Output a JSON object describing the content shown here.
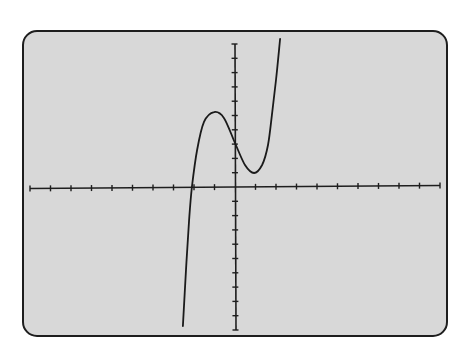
{
  "colors": {
    "background": "#ffffff",
    "screen_fill": "#d8d8d8",
    "frame_stroke": "#1e1e1e",
    "axis": "#1e1e1e",
    "curve": "#1a1a1a"
  },
  "chart_data": {
    "type": "line",
    "title": "",
    "xlabel": "",
    "ylabel": "",
    "xlim": [
      -10,
      10
    ],
    "ylim": [
      -10,
      10
    ],
    "xscale_ticks": 1,
    "yscale_ticks": 1,
    "grid": false,
    "legend": null,
    "axes_style": "graphing-calculator window with tick marks every 1 unit, no tick labels",
    "series": [
      {
        "name": "cubic",
        "description": "cubic curve with local max near (-1, 5.2), local min near (1, 1), y-intercept near 3, real root near -2.1",
        "x": [
          -2.54,
          -2.39,
          -2.24,
          -2.1,
          -1.85,
          -1.51,
          -1.02,
          -0.54,
          0.0,
          0.49,
          0.93,
          1.32,
          1.61,
          1.8,
          2.0,
          2.2
        ],
        "y": [
          -9.72,
          -5.8,
          -2.31,
          0.0,
          2.59,
          4.55,
          5.24,
          4.83,
          3.08,
          1.54,
          0.98,
          1.54,
          2.94,
          5.03,
          7.48,
          10.35
        ]
      }
    ]
  },
  "layout": {
    "frame": {
      "x": 23,
      "y": 31,
      "w": 424,
      "h": 305,
      "r": 14
    },
    "origin_px": {
      "x": 235,
      "y": 187
    },
    "px_per_unit": {
      "x": 20.5,
      "y": 14.3
    }
  }
}
